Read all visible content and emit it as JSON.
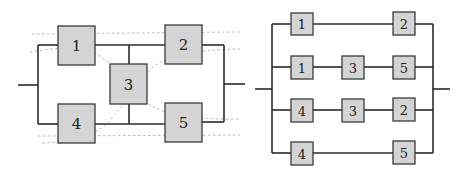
{
  "left_diagram": {
    "title": "bridge network",
    "boxes": [
      {
        "id": "1",
        "label": "1"
      },
      {
        "id": "2",
        "label": "2"
      },
      {
        "id": "3",
        "label": "3"
      },
      {
        "id": "4",
        "label": "4"
      },
      {
        "id": "5",
        "label": "5"
      }
    ]
  },
  "right_diagram": {
    "title": "parallel minimal paths",
    "paths": [
      {
        "boxes": [
          "1",
          "2"
        ]
      },
      {
        "boxes": [
          "1",
          "3",
          "5"
        ]
      },
      {
        "boxes": [
          "4",
          "3",
          "2"
        ]
      },
      {
        "boxes": [
          "4",
          "5"
        ]
      }
    ]
  },
  "colors": {
    "box_fill": "#d4d4d4",
    "box_stroke": "#3a3a3a",
    "wire": "#2a2a2a",
    "dashed_curve": "#b0b0b0"
  }
}
